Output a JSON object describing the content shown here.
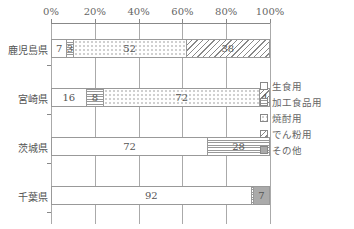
{
  "chart_data": {
    "type": "bar",
    "orientation": "horizontal",
    "stacked": true,
    "percent": true,
    "title": "",
    "xlabel": "",
    "ylabel": "",
    "xlim": [
      0,
      100
    ],
    "x_ticks": [
      "0%",
      "20%",
      "40%",
      "60%",
      "80%",
      "100%"
    ],
    "grid": true,
    "legend_position": "right",
    "categories": [
      "鹿児島県",
      "宮崎県",
      "茨城県",
      "千葉県"
    ],
    "series": [
      {
        "name": "生食用",
        "pattern": "white",
        "values": [
          7,
          16,
          72,
          92
        ]
      },
      {
        "name": "加工食品用",
        "pattern": "horizontal-lines",
        "values": [
          3,
          8,
          28,
          1
        ]
      },
      {
        "name": "焼酎用",
        "pattern": "dots",
        "values": [
          52,
          72,
          0,
          0
        ]
      },
      {
        "name": "でん粉用",
        "pattern": "diagonal-lines",
        "values": [
          38,
          4,
          0,
          0
        ]
      },
      {
        "name": "その他",
        "pattern": "gray",
        "values": [
          0,
          0,
          0,
          7
        ]
      }
    ],
    "data_labels": [
      [
        "7",
        "3",
        "52",
        "38",
        ""
      ],
      [
        "16",
        "8",
        "72",
        "4",
        ""
      ],
      [
        "72",
        "28",
        "",
        "",
        ""
      ],
      [
        "92",
        "",
        "",
        "",
        "7"
      ]
    ]
  },
  "axis": {
    "ticks": [
      "0%",
      "20%",
      "40%",
      "60%",
      "80%",
      "100%"
    ]
  },
  "rows": [
    {
      "label": "鹿児島県"
    },
    {
      "label": "宮崎県"
    },
    {
      "label": "茨城県"
    },
    {
      "label": "千葉県"
    }
  ],
  "legend": {
    "items": [
      {
        "label": "生食用"
      },
      {
        "label": "加工食品用"
      },
      {
        "label": "焼酎用"
      },
      {
        "label": "でん粉用"
      },
      {
        "label": "その他"
      }
    ]
  }
}
